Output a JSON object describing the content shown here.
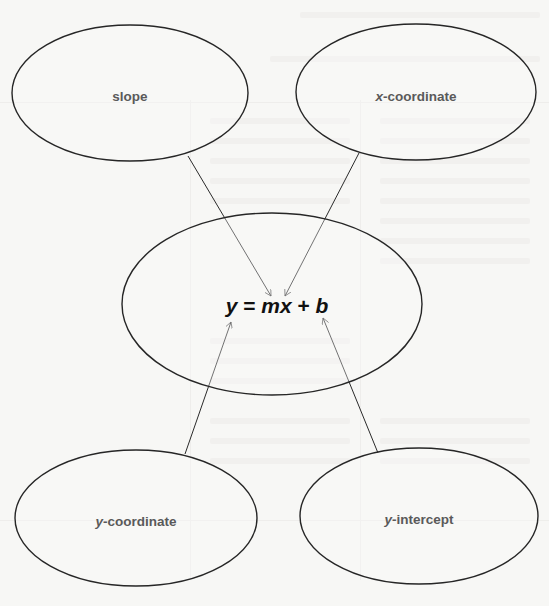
{
  "diagram": {
    "type": "concept-map",
    "center": {
      "id": "equation",
      "parts": {
        "y": "y",
        "eq": " = ",
        "mx": "mx",
        "plus": " + ",
        "b": "b"
      },
      "full_text": "y = mx + b"
    },
    "nodes": [
      {
        "id": "slope",
        "label_var": "",
        "label_rest": "slope",
        "points_to": "m"
      },
      {
        "id": "x-coordinate",
        "label_var": "x",
        "label_rest": "-coordinate",
        "points_to": "x"
      },
      {
        "id": "y-coordinate",
        "label_var": "y",
        "label_rest": "-coordinate",
        "points_to": "y"
      },
      {
        "id": "y-intercept",
        "label_var": "y",
        "label_rest": "-intercept",
        "points_to": "b"
      }
    ],
    "edges": [
      {
        "from": "slope",
        "to": "equation"
      },
      {
        "from": "x-coordinate",
        "to": "equation"
      },
      {
        "from": "y-coordinate",
        "to": "equation"
      },
      {
        "from": "y-intercept",
        "to": "equation"
      }
    ],
    "colors": {
      "stroke": "#262626",
      "label": "#5a5a5a",
      "equation": "#111111",
      "background": "#f7f7f5"
    }
  }
}
